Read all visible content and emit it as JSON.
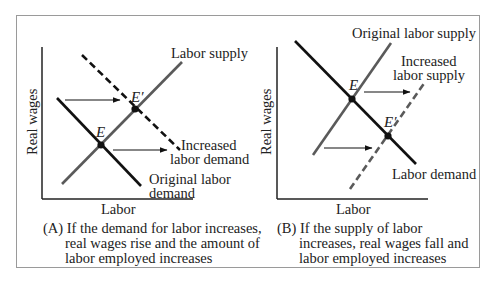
{
  "figure": {
    "colors": {
      "demand": "#111111",
      "supply": "#5a5a5a",
      "axis": "#222222",
      "border": "#9a9a9a"
    },
    "panels": [
      {
        "id": "A",
        "y_axis_label": "Real wages",
        "x_axis_label": "Labor",
        "curves": {
          "supply_label": "Labor supply",
          "demand_label_line1": "Original labor",
          "demand_label_line2": "demand",
          "shifted_label_line1": "Increased",
          "shifted_label_line2": "labor demand"
        },
        "points": {
          "E": "E",
          "E_prime": "E′"
        },
        "caption": {
          "prefix": "(A)",
          "line1": "If the demand for labor increases,",
          "line2": "real wages rise and the amount of",
          "line3": "labor employed increases"
        }
      },
      {
        "id": "B",
        "y_axis_label": "Real wages",
        "x_axis_label": "Labor",
        "curves": {
          "supply_label": "Original labor supply",
          "shifted_label_line1": "Increased",
          "shifted_label_line2": "labor supply",
          "demand_label": "Labor demand"
        },
        "points": {
          "E": "E",
          "E_prime": "E′"
        },
        "caption": {
          "prefix": "(B)",
          "line1": "If the supply of labor",
          "line2": "increases, real wages fall and",
          "line3": "labor employed increases"
        }
      }
    ]
  }
}
